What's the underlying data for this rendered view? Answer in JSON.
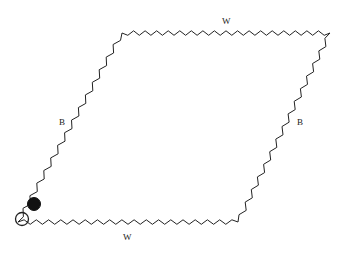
{
  "diagram": {
    "shape": "parallelogram",
    "edge_style": "zigzag",
    "stroke_color": "#222222",
    "corners": {
      "bottom_left": [
        18,
        222
      ],
      "top_left": [
        122,
        33
      ],
      "top_right": [
        330,
        33
      ],
      "bottom_right": [
        238,
        222
      ]
    },
    "edges": [
      {
        "id": "top",
        "label": "W",
        "from": "top_left",
        "to": "top_right",
        "teeth": 36,
        "label_pos": [
          222,
          17
        ]
      },
      {
        "id": "left",
        "label": "B",
        "from": "bottom_left",
        "to": "top_left",
        "teeth": 30,
        "label_pos": [
          59,
          118
        ]
      },
      {
        "id": "right",
        "label": "B",
        "from": "top_right",
        "to": "bottom_right",
        "teeth": 30,
        "label_pos": [
          297,
          118
        ]
      },
      {
        "id": "bottom",
        "label": "W",
        "from": "bottom_right",
        "to": "bottom_left",
        "teeth": 36,
        "label_pos": [
          123,
          233
        ]
      }
    ],
    "markers": [
      {
        "id": "filled-circle",
        "type": "filled",
        "center": [
          34,
          204
        ],
        "radius": 6.5,
        "color": "#111111"
      },
      {
        "id": "open-circle",
        "type": "open",
        "center": [
          22,
          219
        ],
        "radius": 6.5,
        "color": "#222222"
      }
    ]
  }
}
